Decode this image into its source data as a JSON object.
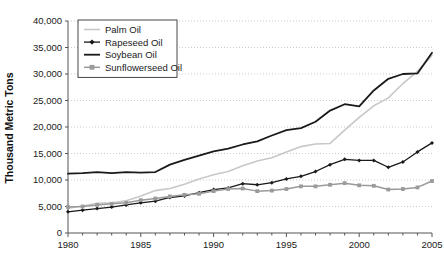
{
  "chart_data": {
    "type": "line",
    "title": "",
    "xlabel": "",
    "ylabel": "Thousand Metric Tons",
    "xlim": [
      1980,
      2005
    ],
    "ylim": [
      0,
      40000
    ],
    "ytick_step": 5000,
    "xtick_step": 5,
    "x_minor_tick_step": 1,
    "grid": "horizontal-dotted",
    "legend_position": "top-left-inside",
    "yticks": [
      "0",
      "5,000",
      "10,000",
      "15,000",
      "20,000",
      "25,000",
      "30,000",
      "35,000",
      "40,000"
    ],
    "ytick_values": [
      0,
      5000,
      10000,
      15000,
      20000,
      25000,
      30000,
      35000,
      40000
    ],
    "xticks": [
      "1980",
      "1985",
      "1990",
      "1995",
      "2000",
      "2005"
    ],
    "xtick_values": [
      1980,
      1985,
      1990,
      1995,
      2000,
      2005
    ],
    "x": [
      1980,
      1981,
      1982,
      1983,
      1984,
      1985,
      1986,
      1987,
      1988,
      1989,
      1990,
      1991,
      1992,
      1993,
      1994,
      1995,
      1996,
      1997,
      1998,
      1999,
      2000,
      2001,
      2002,
      2003,
      2004,
      2005
    ],
    "series": [
      {
        "name": "Palm Oil",
        "color": "#c8c8c8",
        "marker": "none",
        "line_width": 1.6,
        "values": [
          4700,
          5100,
          5600,
          5700,
          6100,
          7000,
          8000,
          8400,
          9200,
          10200,
          11000,
          11600,
          12700,
          13600,
          14200,
          15300,
          16300,
          16800,
          16900,
          19400,
          21800,
          24000,
          25500,
          28200,
          30500,
          33500
        ]
      },
      {
        "name": "Rapeseed Oil",
        "color": "#1a1a1a",
        "marker": "diamond",
        "line_width": 1.3,
        "values": [
          4000,
          4300,
          4600,
          4900,
          5300,
          5700,
          6000,
          6700,
          7000,
          7600,
          8200,
          8500,
          9300,
          9100,
          9500,
          10200,
          10700,
          11600,
          12900,
          13900,
          13700,
          13700,
          12400,
          13400,
          15300,
          17000
        ]
      },
      {
        "name": "Soybean Oil",
        "color": "#1a1a1a",
        "marker": "none",
        "line_width": 1.8,
        "values": [
          11200,
          11300,
          11500,
          11300,
          11500,
          11400,
          11500,
          12900,
          13800,
          14600,
          15400,
          15900,
          16700,
          17300,
          18400,
          19400,
          19800,
          21000,
          23100,
          24300,
          23900,
          26900,
          29100,
          30000,
          30100,
          34000
        ]
      },
      {
        "name": "Sunflowerseed Oil",
        "color": "#9a9a9a",
        "marker": "square",
        "line_width": 1.5,
        "values": [
          4900,
          5000,
          5300,
          5500,
          5700,
          6200,
          6500,
          6900,
          7200,
          7400,
          7900,
          8300,
          8400,
          7900,
          8000,
          8300,
          8800,
          8800,
          9100,
          9400,
          9000,
          8900,
          8200,
          8300,
          8600,
          9800
        ]
      }
    ]
  }
}
